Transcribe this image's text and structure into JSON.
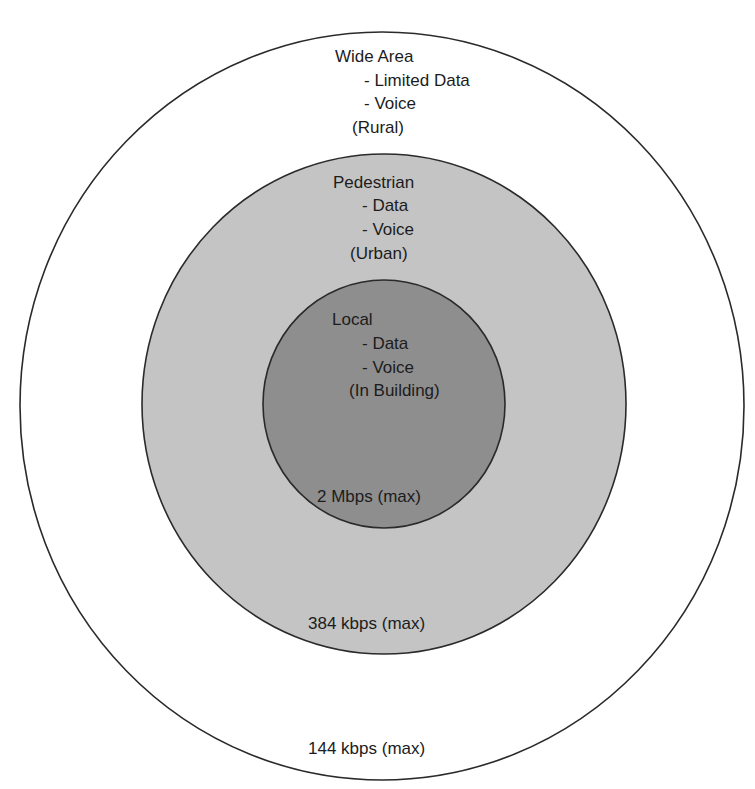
{
  "diagram": {
    "type": "nested-coverage-zones",
    "zones": [
      {
        "id": "wide-area",
        "title": "Wide Area",
        "services": [
          "- Limited Data",
          "- Voice"
        ],
        "environment": "(Rural)",
        "rate": "144 kbps (max)",
        "fill": "#ffffff"
      },
      {
        "id": "pedestrian",
        "title": "Pedestrian",
        "services": [
          "- Data",
          "- Voice"
        ],
        "environment": "(Urban)",
        "rate": "384 kbps (max)",
        "fill": "#c4c4c4"
      },
      {
        "id": "local",
        "title": "Local",
        "services": [
          "- Data",
          "- Voice"
        ],
        "environment": "(In Building)",
        "rate": "2 Mbps (max)",
        "fill": "#8e8e8e"
      }
    ],
    "stroke_color": "#2a2a2a",
    "text_color": "#1c1c1c"
  }
}
